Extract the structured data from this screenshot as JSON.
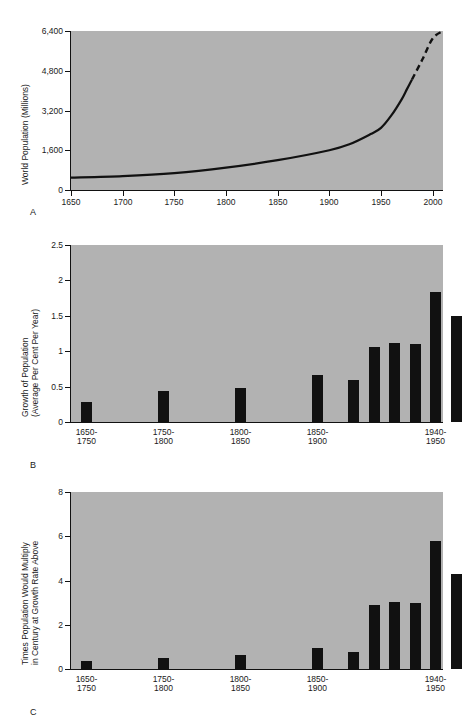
{
  "figure": {
    "background": "#ffffff",
    "plot_background": "#b2b2b2",
    "ink": "#111111"
  },
  "panels": {
    "a": {
      "letter": "A"
    },
    "b": {
      "letter": "B"
    },
    "c": {
      "letter": "C"
    }
  },
  "chart_data": [
    {
      "id": "A",
      "type": "line",
      "title": "",
      "xlabel": "",
      "ylabel": "World Population (Millions)",
      "ylabel_lines": [
        "World Population (Millions)"
      ],
      "xlim": [
        1650,
        2010
      ],
      "ylim": [
        0,
        6400
      ],
      "grid": false,
      "legend": "none",
      "xticks": [
        1650,
        1700,
        1750,
        1800,
        1850,
        1900,
        1950,
        2000
      ],
      "xticklabels": [
        "1650",
        "1700",
        "1750",
        "1800",
        "1850",
        "1900",
        "1950",
        "2000"
      ],
      "yticks": [
        0,
        1600,
        3200,
        4800,
        6400
      ],
      "yticklabels": [
        "0",
        "1,600",
        "3,200",
        "4,800",
        "6,400"
      ],
      "series": [
        {
          "name": "World population (historical)",
          "style": "solid",
          "x": [
            1650,
            1700,
            1750,
            1800,
            1850,
            1900,
            1920,
            1940,
            1950,
            1960,
            1970,
            1975,
            1980
          ],
          "y": [
            500,
            560,
            680,
            900,
            1200,
            1600,
            1850,
            2250,
            2500,
            3000,
            3650,
            4050,
            4450
          ]
        },
        {
          "name": "World population (projected)",
          "style": "dashed",
          "x": [
            1980,
            1990,
            2000,
            2010
          ],
          "y": [
            4450,
            5250,
            6100,
            6400
          ]
        }
      ],
      "annotations": [
        "Dashed segment after about 1980 indicates projection"
      ]
    },
    {
      "id": "B",
      "type": "bar",
      "title": "",
      "xlabel": "",
      "ylabel": "Growth of Population (Average Per Cent Per Year)",
      "ylabel_lines": [
        "Growth of Population",
        "(Average Per Cent Per Year)"
      ],
      "ylim": [
        0,
        2.5
      ],
      "grid": false,
      "legend": "none",
      "yticks": [
        0,
        0.5,
        1,
        1.5,
        2,
        2.5
      ],
      "yticklabels": [
        "0",
        "0.5",
        "1",
        "1.5",
        "2",
        "2.5"
      ],
      "categories": [
        "1650-1750",
        "1750-1800",
        "1800-1850",
        "1850-1900",
        "",
        "",
        "",
        "",
        "1940-1950",
        "",
        "",
        "",
        "1990-2000"
      ],
      "labeled_ticks": [
        {
          "index": 0,
          "lines": [
            "1650-",
            "1750"
          ]
        },
        {
          "index": 1,
          "lines": [
            "1750-",
            "1800"
          ]
        },
        {
          "index": 2,
          "lines": [
            "1800-",
            "1850"
          ]
        },
        {
          "index": 3,
          "lines": [
            "1850-",
            "1900"
          ]
        },
        {
          "index": 8,
          "lines": [
            "1940-",
            "1950"
          ]
        },
        {
          "index": 12,
          "lines": [
            "1990-",
            "2000"
          ]
        }
      ],
      "values": [
        0.29,
        0.44,
        0.48,
        0.67,
        0.6,
        1.06,
        1.12,
        1.1,
        1.83,
        1.5,
        1.92,
        1.98,
        2.03
      ]
    },
    {
      "id": "C",
      "type": "bar",
      "title": "",
      "xlabel": "",
      "ylabel": "Times Population Would Multiply in Century at Growth Rate Above",
      "ylabel_lines": [
        "Times Population Would Multiply",
        "in Century at Growth Rate Above"
      ],
      "ylim": [
        0,
        8
      ],
      "grid": false,
      "legend": "none",
      "yticks": [
        0,
        2,
        4,
        6,
        8
      ],
      "yticklabels": [
        "0",
        "2",
        "4",
        "6",
        "8"
      ],
      "categories": [
        "1650-1750",
        "1750-1800",
        "1800-1850",
        "1850-1900",
        "",
        "",
        "",
        "",
        "1940-1950",
        "",
        "",
        "",
        "1990-2000"
      ],
      "labeled_ticks": [
        {
          "index": 0,
          "lines": [
            "1650-",
            "1750"
          ]
        },
        {
          "index": 1,
          "lines": [
            "1750-",
            "1800"
          ]
        },
        {
          "index": 2,
          "lines": [
            "1800-",
            "1850"
          ]
        },
        {
          "index": 3,
          "lines": [
            "1850-",
            "1900"
          ]
        },
        {
          "index": 8,
          "lines": [
            "1940-",
            "1950"
          ]
        },
        {
          "index": 12,
          "lines": [
            "1990-",
            "2000"
          ]
        }
      ],
      "values": [
        0.37,
        0.5,
        0.62,
        0.97,
        0.78,
        2.88,
        3.05,
        2.98,
        5.8,
        4.28,
        6.82,
        7.18,
        7.45
      ]
    }
  ]
}
